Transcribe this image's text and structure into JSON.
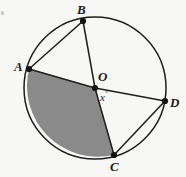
{
  "figure": {
    "kind": "circle-geometry-diagram",
    "background_color": "#f7f7f5",
    "stroke_color": "#1d1d1d",
    "shaded_sector_color": "#8a8a8a",
    "circle": {
      "center_label": "O",
      "center_x": 95,
      "center_y": 88,
      "radius": 71
    },
    "points": [
      {
        "label": "A",
        "x": 29,
        "y": 69
      },
      {
        "label": "B",
        "x": 83,
        "y": 21
      },
      {
        "label": "C",
        "x": 114,
        "y": 155
      },
      {
        "label": "D",
        "x": 165,
        "y": 101
      },
      {
        "label": "O",
        "x": 95,
        "y": 88
      }
    ],
    "angle_label": {
      "value": "x",
      "degree_symbol": "°",
      "at_vertex": "O"
    },
    "segments": [
      {
        "from": "A",
        "to": "B",
        "type": "chord"
      },
      {
        "from": "B",
        "to": "O",
        "type": "radius"
      },
      {
        "from": "O",
        "to": "C",
        "type": "radius"
      },
      {
        "from": "A",
        "to": "O",
        "type": "radius"
      },
      {
        "from": "O",
        "to": "D",
        "type": "radius"
      },
      {
        "from": "C",
        "to": "D",
        "type": "chord"
      }
    ],
    "shaded_sector": {
      "from": "A",
      "to": "C",
      "direction": "counterclockwise-through-bottom-left"
    }
  }
}
